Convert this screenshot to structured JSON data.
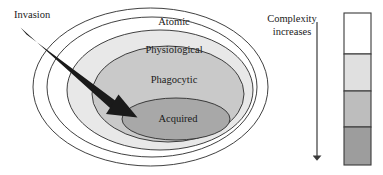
{
  "figure": {
    "background_color": "#ffffff"
  },
  "rings": [
    {
      "key": "atomic",
      "label": "Atomic",
      "fill": "#ffffff",
      "stroke": "#2b2b2b",
      "level": 1,
      "label_x": 174,
      "label_y": 25
    },
    {
      "key": "physiological",
      "label": "Physiological",
      "fill": "#e8e8e8",
      "stroke": "#2b2b2b",
      "level": 2,
      "label_x": 174,
      "label_y": 53
    },
    {
      "key": "phagocytic",
      "label": "Phagocytic",
      "fill": "#c9c9c9",
      "stroke": "#2b2b2b",
      "level": 3,
      "label_x": 174,
      "label_y": 83
    },
    {
      "key": "acquired",
      "label": "Acquired",
      "fill": "#a8a8a8",
      "stroke": "#2b2b2b",
      "level": 4,
      "label_x": 178,
      "label_y": 119
    }
  ],
  "invasion": {
    "label": "Invasion",
    "label_x": 14,
    "label_y": 18,
    "arrow_color": "#1a1a1a",
    "start_x": 22,
    "start_y": 31,
    "end_x": 136,
    "end_y": 116
  },
  "complexity": {
    "line1": "Complexity",
    "line2": "increases",
    "line1_x": 292,
    "line1_y": 22,
    "line2_x": 292,
    "line2_y": 35,
    "arrow_color": "#3a3a3a",
    "arrow_x": 317,
    "arrow_top": 22,
    "arrow_bottom": 166
  },
  "scale_bar": {
    "x": 344,
    "y": 13,
    "width": 27,
    "height": 152,
    "border_color": "#3a3a3a",
    "segments": [
      {
        "key": "atomic",
        "fill": "#ffffff",
        "height_fraction": 0.27
      },
      {
        "key": "physiological",
        "fill": "#e0e0e0",
        "height_fraction": 0.24
      },
      {
        "key": "phagocytic",
        "fill": "#bdbdbd",
        "height_fraction": 0.24
      },
      {
        "key": "acquired",
        "fill": "#9d9d9d",
        "height_fraction": 0.25
      }
    ]
  }
}
